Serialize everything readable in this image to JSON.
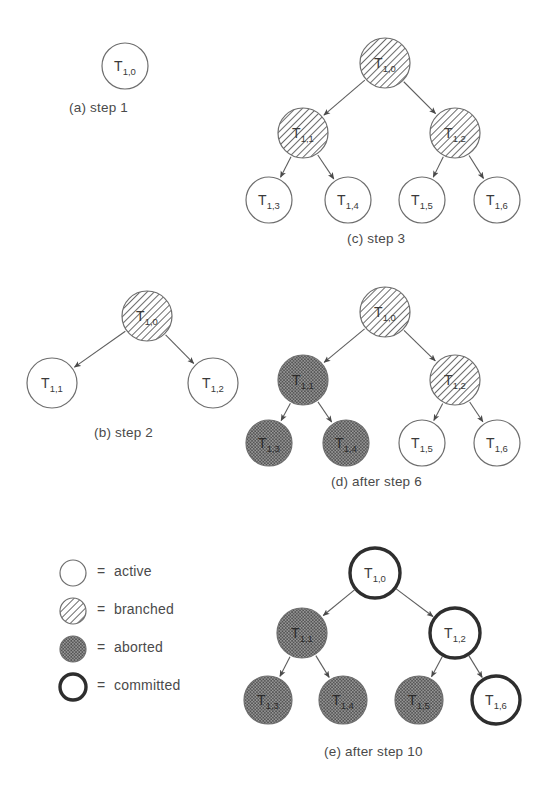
{
  "figure": {
    "background": "#ffffff",
    "ink": "#5a5a5a",
    "ink_strong": "#333333"
  },
  "styles": {
    "active": {
      "name": "active",
      "fill": "#ffffff",
      "stroke": "#6e6e6e",
      "stroke_width": 1.2,
      "pattern": "none"
    },
    "branched": {
      "name": "branched",
      "fill": "#ffffff",
      "stroke": "#6e6e6e",
      "stroke_width": 1.2,
      "pattern": "diagonal-hatch"
    },
    "aborted": {
      "name": "aborted",
      "fill": "#8e8e8e",
      "stroke": "#6e6e6e",
      "stroke_width": 1.2,
      "pattern": "dot-grid"
    },
    "committed": {
      "name": "committed",
      "fill": "#ffffff",
      "stroke": "#2e2e2e",
      "stroke_width": 3.4,
      "pattern": "none"
    }
  },
  "legend": {
    "equals": "=",
    "items": [
      {
        "swatch": "active",
        "label": "active"
      },
      {
        "swatch": "branched",
        "label": "branched"
      },
      {
        "swatch": "aborted",
        "label": "aborted"
      },
      {
        "swatch": "committed",
        "label": "committed"
      }
    ]
  },
  "panels": [
    {
      "id": "a",
      "caption": "(a) step 1",
      "caption_x": 69,
      "caption_y": 100,
      "nodes": [
        {
          "id": "n0",
          "label": "T",
          "sub": "1,0",
          "state": "active",
          "cx": 125,
          "cy": 66,
          "r": 23
        }
      ],
      "edges": []
    },
    {
      "id": "b",
      "caption": "(b) step 2",
      "caption_x": 94,
      "caption_y": 425,
      "nodes": [
        {
          "id": "n0",
          "label": "T",
          "sub": "1,0",
          "state": "branched",
          "cx": 147,
          "cy": 316,
          "r": 25
        },
        {
          "id": "n1",
          "label": "T",
          "sub": "1,1",
          "state": "active",
          "cx": 52,
          "cy": 383,
          "r": 25
        },
        {
          "id": "n2",
          "label": "T",
          "sub": "1,2",
          "state": "active",
          "cx": 213,
          "cy": 383,
          "r": 25
        }
      ],
      "edges": [
        {
          "from": "n0",
          "to": "n1"
        },
        {
          "from": "n0",
          "to": "n2"
        }
      ]
    },
    {
      "id": "c",
      "caption": "(c) step 3",
      "caption_x": 347,
      "caption_y": 231,
      "nodes": [
        {
          "id": "n0",
          "label": "T",
          "sub": "1,0",
          "state": "branched",
          "cx": 385,
          "cy": 63,
          "r": 25
        },
        {
          "id": "n1",
          "label": "T",
          "sub": "1,1",
          "state": "branched",
          "cx": 303,
          "cy": 133,
          "r": 25
        },
        {
          "id": "n2",
          "label": "T",
          "sub": "1,2",
          "state": "branched",
          "cx": 455,
          "cy": 133,
          "r": 25
        },
        {
          "id": "n3",
          "label": "T",
          "sub": "1,3",
          "state": "active",
          "cx": 269,
          "cy": 200,
          "r": 23
        },
        {
          "id": "n4",
          "label": "T",
          "sub": "1,4",
          "state": "active",
          "cx": 348,
          "cy": 200,
          "r": 23
        },
        {
          "id": "n5",
          "label": "T",
          "sub": "1,5",
          "state": "active",
          "cx": 422,
          "cy": 200,
          "r": 23
        },
        {
          "id": "n6",
          "label": "T",
          "sub": "1,6",
          "state": "active",
          "cx": 497,
          "cy": 200,
          "r": 23
        }
      ],
      "edges": [
        {
          "from": "n0",
          "to": "n1"
        },
        {
          "from": "n0",
          "to": "n2"
        },
        {
          "from": "n1",
          "to": "n3"
        },
        {
          "from": "n1",
          "to": "n4"
        },
        {
          "from": "n2",
          "to": "n5"
        },
        {
          "from": "n2",
          "to": "n6"
        }
      ]
    },
    {
      "id": "d",
      "caption": "(d) after step 6",
      "caption_x": 331,
      "caption_y": 474,
      "nodes": [
        {
          "id": "n0",
          "label": "T",
          "sub": "1,0",
          "state": "branched",
          "cx": 385,
          "cy": 312,
          "r": 25
        },
        {
          "id": "n1",
          "label": "T",
          "sub": "1,1",
          "state": "aborted",
          "cx": 303,
          "cy": 380,
          "r": 25
        },
        {
          "id": "n2",
          "label": "T",
          "sub": "1,2",
          "state": "branched",
          "cx": 455,
          "cy": 380,
          "r": 25
        },
        {
          "id": "n3",
          "label": "T",
          "sub": "1,3",
          "state": "aborted",
          "cx": 269,
          "cy": 443,
          "r": 23
        },
        {
          "id": "n4",
          "label": "T",
          "sub": "1,4",
          "state": "aborted",
          "cx": 346,
          "cy": 443,
          "r": 23
        },
        {
          "id": "n5",
          "label": "T",
          "sub": "1,5",
          "state": "active",
          "cx": 422,
          "cy": 443,
          "r": 23
        },
        {
          "id": "n6",
          "label": "T",
          "sub": "1,6",
          "state": "active",
          "cx": 497,
          "cy": 443,
          "r": 23
        }
      ],
      "edges": [
        {
          "from": "n0",
          "to": "n1"
        },
        {
          "from": "n0",
          "to": "n2"
        },
        {
          "from": "n1",
          "to": "n3"
        },
        {
          "from": "n1",
          "to": "n4"
        },
        {
          "from": "n2",
          "to": "n5"
        },
        {
          "from": "n2",
          "to": "n6"
        }
      ]
    },
    {
      "id": "e",
      "caption": "(e) after step 10",
      "caption_x": 324,
      "caption_y": 744,
      "nodes": [
        {
          "id": "n0",
          "label": "T",
          "sub": "1,0",
          "state": "committed",
          "cx": 375,
          "cy": 573,
          "r": 25
        },
        {
          "id": "n1",
          "label": "T",
          "sub": "1,1",
          "state": "aborted",
          "cx": 302,
          "cy": 633,
          "r": 25
        },
        {
          "id": "n2",
          "label": "T",
          "sub": "1,2",
          "state": "committed",
          "cx": 455,
          "cy": 633,
          "r": 25
        },
        {
          "id": "n3",
          "label": "T",
          "sub": "1,3",
          "state": "aborted",
          "cx": 268,
          "cy": 700,
          "r": 24
        },
        {
          "id": "n4",
          "label": "T",
          "sub": "1,4",
          "state": "aborted",
          "cx": 343,
          "cy": 700,
          "r": 24
        },
        {
          "id": "n5",
          "label": "T",
          "sub": "1,5",
          "state": "aborted",
          "cx": 419,
          "cy": 700,
          "r": 24
        },
        {
          "id": "n6",
          "label": "T",
          "sub": "1,6",
          "state": "committed",
          "cx": 496,
          "cy": 700,
          "r": 24
        }
      ],
      "edges": [
        {
          "from": "n0",
          "to": "n1"
        },
        {
          "from": "n0",
          "to": "n2"
        },
        {
          "from": "n1",
          "to": "n3"
        },
        {
          "from": "n1",
          "to": "n4"
        },
        {
          "from": "n2",
          "to": "n5"
        },
        {
          "from": "n2",
          "to": "n6"
        }
      ]
    }
  ],
  "legend_layout": {
    "swatch_cx": 73,
    "swatch_r": 13,
    "rows_y": [
      573,
      611,
      649,
      687
    ],
    "equals_x": 97,
    "label_x": 114
  }
}
